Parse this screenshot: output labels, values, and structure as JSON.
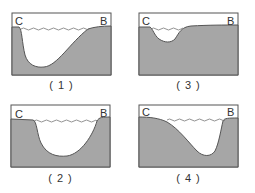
{
  "figure": {
    "colors": {
      "ground": "#a6a6a6",
      "outline": "#555555",
      "water_line": "#777777",
      "background": "#ffffff"
    },
    "panels": [
      {
        "id": "1",
        "caption": "( 1 )",
        "left_label": "C",
        "right_label": "B",
        "deep_side": "left-steep, gentle right slope"
      },
      {
        "id": "2",
        "caption": "( 2 )",
        "left_label": "C",
        "right_label": "B",
        "deep_side": "symmetric U-shape, steep both sides"
      },
      {
        "id": "3",
        "caption": "( 3 )",
        "left_label": "C",
        "right_label": "B",
        "deep_side": "shallow channel near C"
      },
      {
        "id": "4",
        "caption": "( 4 )",
        "left_label": "C",
        "right_label": "B",
        "deep_side": "gentle left slope, steep right near B"
      }
    ]
  }
}
